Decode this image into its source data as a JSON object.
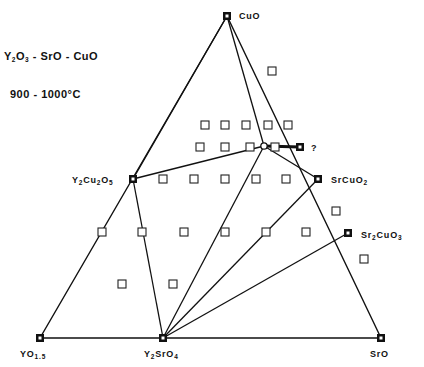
{
  "title": {
    "system": "Y2O3 - SrO - CuO",
    "system_parts": [
      "Y",
      "2",
      "O",
      "3",
      " - SrO - CuO"
    ],
    "temperature": "900 - 1000°C"
  },
  "colors": {
    "line": "#111111",
    "background": "#ffffff",
    "filled_marker": "#111111",
    "open_marker_stroke": "#222222"
  },
  "vertices": {
    "top": {
      "name": "CuO",
      "x": 227,
      "y": 16
    },
    "left": {
      "name": "YO1.5",
      "base": "YO",
      "sub": "1.5",
      "x": 40,
      "y": 338
    },
    "right": {
      "name": "SrO",
      "x": 381,
      "y": 338
    }
  },
  "phases": [
    {
      "id": "cuo",
      "label": "CuO",
      "x": 227,
      "y": 16
    },
    {
      "id": "yo15",
      "label": "YO1.5",
      "x": 40,
      "y": 338
    },
    {
      "id": "sro",
      "label": "SrO",
      "x": 381,
      "y": 338
    },
    {
      "id": "y2sro4",
      "label": "Y2SrO4",
      "x": 163,
      "y": 338
    },
    {
      "id": "y2cu2o5",
      "label": "Y2Cu2O5",
      "x": 133,
      "y": 179
    },
    {
      "id": "srcuo2",
      "label": "SrCuO2",
      "x": 318,
      "y": 179
    },
    {
      "id": "sr2cuo3",
      "label": "Sr2CuO3",
      "x": 348,
      "y": 233
    },
    {
      "id": "unknown",
      "label": "?",
      "x": 300,
      "y": 147
    }
  ],
  "labels": {
    "cuo": "CuO",
    "yo15_base": "YO",
    "yo15_sub": "1.5",
    "sro": "SrO",
    "y2sro4": [
      "Y",
      "2",
      "SrO",
      "4"
    ],
    "y2cu2o5": [
      "Y",
      "2",
      "Cu",
      "2",
      "O",
      "5"
    ],
    "srcuo2": [
      "SrCuO",
      "2"
    ],
    "sr2cuo3": [
      "Sr",
      "2",
      "CuO",
      "3"
    ],
    "unknown": "?"
  },
  "tie_lines": [
    {
      "from": "y2cu2o5",
      "to": "cuo"
    },
    {
      "from": "y2cu2o5",
      "to": "y2sro4"
    },
    {
      "from": "y2cu2o5",
      "to": "junction"
    },
    {
      "from": "cuo",
      "to": "junction"
    },
    {
      "from": "junction",
      "to": "y2sro4"
    },
    {
      "from": "junction",
      "to": "srcuo2"
    },
    {
      "from": "junction",
      "to": "unknown",
      "bold": true
    },
    {
      "from": "srcuo2",
      "to": "y2sro4"
    },
    {
      "from": "sr2cuo3",
      "to": "y2sro4"
    }
  ],
  "junction": {
    "x": 264,
    "y": 146
  },
  "open_samples": [
    {
      "x": 272,
      "y": 71
    },
    {
      "x": 205,
      "y": 125
    },
    {
      "x": 225,
      "y": 125
    },
    {
      "x": 246,
      "y": 125
    },
    {
      "x": 268,
      "y": 125
    },
    {
      "x": 288,
      "y": 125
    },
    {
      "x": 200,
      "y": 147
    },
    {
      "x": 225,
      "y": 147
    },
    {
      "x": 250,
      "y": 147
    },
    {
      "x": 275,
      "y": 147
    },
    {
      "x": 163,
      "y": 179
    },
    {
      "x": 194,
      "y": 179
    },
    {
      "x": 225,
      "y": 179
    },
    {
      "x": 256,
      "y": 179
    },
    {
      "x": 286,
      "y": 179
    },
    {
      "x": 336,
      "y": 211
    },
    {
      "x": 102,
      "y": 232
    },
    {
      "x": 142,
      "y": 232
    },
    {
      "x": 184,
      "y": 232
    },
    {
      "x": 225,
      "y": 232
    },
    {
      "x": 266,
      "y": 232
    },
    {
      "x": 306,
      "y": 232
    },
    {
      "x": 364,
      "y": 259
    },
    {
      "x": 122,
      "y": 284
    },
    {
      "x": 173,
      "y": 284
    }
  ]
}
